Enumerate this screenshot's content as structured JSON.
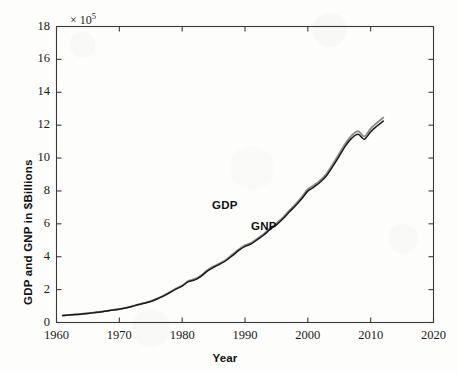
{
  "figure": {
    "background_color": "#fdfdfc",
    "axis_color": "#3a3a3a",
    "exponent_label": "× 10",
    "exponent_power": "5"
  },
  "axes": {
    "x_title": "Year",
    "y_title": "GDP and GNP in $Billions",
    "x_ticks": [
      "1960",
      "1970",
      "1980",
      "1990",
      "2000",
      "2010",
      "2020"
    ],
    "y_ticks": [
      "0",
      "2",
      "4",
      "6",
      "8",
      "10",
      "12",
      "14",
      "16",
      "18"
    ]
  },
  "annotations": {
    "gdp_label": "GDP",
    "gnp_label": "GNP"
  },
  "chart_data": {
    "type": "line",
    "title": "",
    "subtitle": "",
    "xlabel": "Year",
    "ylabel": "GDP and GNP in $Billions",
    "y_multiplier": "×10^5",
    "y_multiplier_value": 100000,
    "xlim": [
      1960,
      2020
    ],
    "ylim": [
      0,
      18
    ],
    "x_tick_values": [
      1960,
      1970,
      1980,
      1990,
      2000,
      2010,
      2020
    ],
    "y_tick_values": [
      0,
      2,
      4,
      6,
      8,
      10,
      12,
      14,
      16,
      18
    ],
    "grid": false,
    "legend": "inline-annotation",
    "legend_position": "on-curve",
    "colors": {
      "GDP": "#1a1a1a",
      "GNP": "#8c8c8c"
    },
    "x": [
      1961,
      1962,
      1963,
      1964,
      1965,
      1966,
      1967,
      1968,
      1969,
      1970,
      1971,
      1972,
      1973,
      1974,
      1975,
      1976,
      1977,
      1978,
      1979,
      1980,
      1981,
      1982,
      1983,
      1984,
      1985,
      1986,
      1987,
      1988,
      1989,
      1990,
      1991,
      1992,
      1993,
      1994,
      1995,
      1996,
      1997,
      1998,
      1999,
      2000,
      2001,
      2002,
      2003,
      2004,
      2005,
      2006,
      2007,
      2008,
      2009,
      2010,
      2011,
      2012
    ],
    "series": [
      {
        "name": "GDP",
        "color": "#1a1a1a",
        "values": [
          0.42,
          0.45,
          0.48,
          0.51,
          0.55,
          0.6,
          0.64,
          0.7,
          0.76,
          0.81,
          0.88,
          0.97,
          1.08,
          1.17,
          1.28,
          1.43,
          1.6,
          1.81,
          2.03,
          2.21,
          2.49,
          2.59,
          2.81,
          3.13,
          3.36,
          3.55,
          3.77,
          4.07,
          4.38,
          4.63,
          4.78,
          5.05,
          5.32,
          5.66,
          5.94,
          6.29,
          6.7,
          7.09,
          7.51,
          7.99,
          8.25,
          8.54,
          8.94,
          9.51,
          10.12,
          10.74,
          11.21,
          11.45,
          11.15,
          11.6,
          11.95,
          12.25
        ]
      },
      {
        "name": "GNP",
        "color": "#8c8c8c",
        "values": [
          0.43,
          0.46,
          0.49,
          0.52,
          0.56,
          0.61,
          0.65,
          0.71,
          0.77,
          0.82,
          0.89,
          0.98,
          1.1,
          1.19,
          1.3,
          1.45,
          1.62,
          1.84,
          2.06,
          2.25,
          2.53,
          2.63,
          2.85,
          3.18,
          3.41,
          3.6,
          3.82,
          4.13,
          4.44,
          4.69,
          4.84,
          5.11,
          5.38,
          5.73,
          6.02,
          6.37,
          6.79,
          7.18,
          7.61,
          8.1,
          8.36,
          8.66,
          9.06,
          9.65,
          10.27,
          10.9,
          11.38,
          11.63,
          11.32,
          11.79,
          12.15,
          12.46
        ]
      }
    ],
    "notable_features": [
      "Near-flat low growth through the 1960s starting around 0.4",
      "Acceleration from the mid-1970s onward",
      "Plateau around the 2001 recession",
      "Pronounced dip at the 2008-2009 recession",
      "Series end near 17 on the plotted scale around 2011-2012"
    ]
  }
}
